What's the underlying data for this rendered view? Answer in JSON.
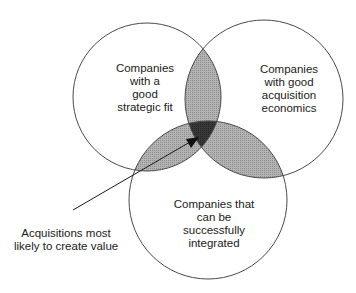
{
  "diagram": {
    "type": "venn",
    "sets": [
      {
        "id": "strategic",
        "label_lines": [
          "Companies",
          "with a",
          "good",
          "strategic fit"
        ]
      },
      {
        "id": "economics",
        "label_lines": [
          "Companies",
          "with good",
          "acquisition",
          "economics"
        ]
      },
      {
        "id": "integration",
        "label_lines": [
          "Companies that",
          "can be",
          "successfully",
          "integrated"
        ]
      }
    ],
    "callout": {
      "target": "intersection-of-all-three",
      "label_lines": [
        "Acquisitions most",
        "likely to create value"
      ]
    },
    "colors": {
      "outline": "#4a4a4a",
      "pairwise_overlap": "#a9a9a9",
      "triple_overlap": "#333333",
      "arrow": "#1a1a1a",
      "background": "#ffffff"
    }
  }
}
